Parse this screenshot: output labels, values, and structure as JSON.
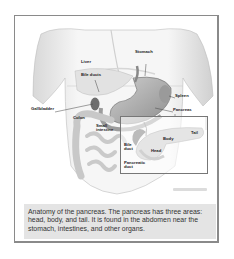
{
  "figure": {
    "title": "Anatomy of the pancreas",
    "labels": {
      "liver": "Liver",
      "stomach": "Stomach",
      "bile_ducts": "Bile ducts",
      "spleen": "Spleen",
      "gallbladder": "Gallbladder",
      "pancreas": "Pancreas",
      "colon": "Colon",
      "small_intestine_1": "Small",
      "small_intestine_2": "intestine"
    },
    "inset_labels": {
      "body": "Body",
      "tail": "Tail",
      "head": "Head",
      "bile_duct_1": "Bile",
      "bile_duct_2": "duct",
      "pancreatic_duct_1": "Pancreatic",
      "pancreatic_duct_2": "duct"
    },
    "caption": "Anatomy of the pancreas. The pancreas has three areas: head, body, and tail. It is found in the abdomen near the stomach, intestines, and other organs."
  }
}
